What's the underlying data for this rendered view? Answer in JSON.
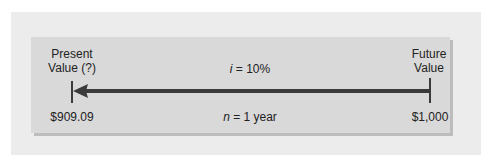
{
  "diagram": {
    "present": {
      "label_line1": "Present",
      "label_line2": "Value (?)",
      "value": "$909.09"
    },
    "future": {
      "label_line1": "Future",
      "label_line2": "Value",
      "value": "$1,000"
    },
    "rate": {
      "symbol": "i",
      "text": " = 10%"
    },
    "period": {
      "symbol": "n",
      "text": " = 1 year"
    },
    "arrow_direction": "future-to-present",
    "colors": {
      "outer_bg": "#ececec",
      "panel_bg": "#d9d9d9",
      "arrow": "#3a3a3a"
    }
  }
}
